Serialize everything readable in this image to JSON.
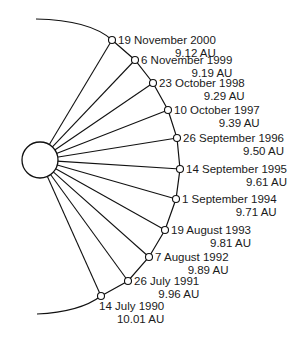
{
  "diagram": {
    "title": "",
    "central_body": "sun",
    "observations": [
      {
        "date": "19 November 2000",
        "distance": "9.12 AU"
      },
      {
        "date": "6 November 1999",
        "distance": "9.19 AU"
      },
      {
        "date": "23 October 1998",
        "distance": "9.29 AU"
      },
      {
        "date": "10 October 1997",
        "distance": "9.39 AU"
      },
      {
        "date": "26 September 1996",
        "distance": "9.50 AU"
      },
      {
        "date": "14 September 1995",
        "distance": "9.61 AU"
      },
      {
        "date": "1 September 1994",
        "distance": "9.71 AU"
      },
      {
        "date": "19 August 1993",
        "distance": "9.81 AU"
      },
      {
        "date": "7 August 1992",
        "distance": "9.89 AU"
      },
      {
        "date": "26 July 1991",
        "distance": "9.96 AU"
      },
      {
        "date": "14 July 1990",
        "distance": "10.01 AU"
      }
    ]
  }
}
